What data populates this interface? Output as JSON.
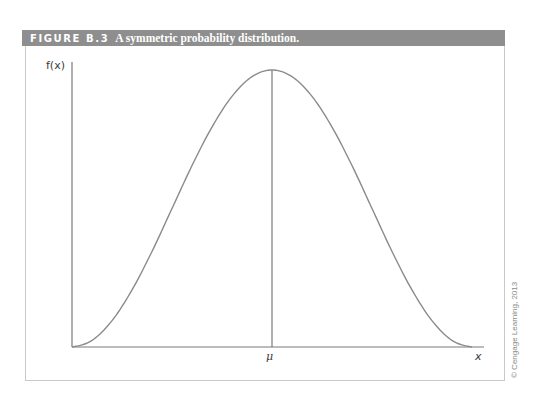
{
  "figure": {
    "label": "FIGURE B.3",
    "caption": "A symmetric probability distribution.",
    "copyright": "© Cengage Learning, 2013",
    "colors": {
      "header_bg": "#8e8e8e",
      "header_text": "#ffffff",
      "curve": "#8a8a8a",
      "axis": "#7a7a7a",
      "frame": "#c9c9c9"
    }
  },
  "chart_data": {
    "type": "line",
    "title": "A symmetric probability distribution.",
    "xlabel": "x",
    "ylabel": "f(x)",
    "x_tick_labels": [
      "μ"
    ],
    "mean_marker": {
      "label": "μ",
      "x": 0,
      "vertical_line": true
    },
    "grid": false,
    "legend": null,
    "x": [
      -1.0,
      -0.9,
      -0.8,
      -0.7,
      -0.6,
      -0.5,
      -0.4,
      -0.3,
      -0.2,
      -0.1,
      0.0,
      0.1,
      0.2,
      0.3,
      0.4,
      0.5,
      0.6,
      0.7,
      0.8,
      0.9,
      1.0
    ],
    "y": [
      0.0,
      0.024,
      0.095,
      0.206,
      0.345,
      0.5,
      0.655,
      0.794,
      0.905,
      0.976,
      1.0,
      0.976,
      0.905,
      0.794,
      0.655,
      0.5,
      0.345,
      0.206,
      0.095,
      0.024,
      0.0
    ],
    "xlim": [
      -1.0,
      1.06
    ],
    "ylim": [
      0,
      1.08
    ]
  }
}
